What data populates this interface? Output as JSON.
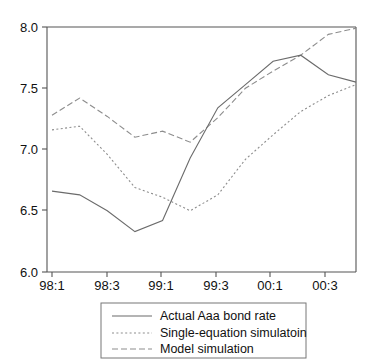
{
  "chart_data": {
    "type": "line",
    "title": "",
    "subtitle": "",
    "xlabel": "",
    "ylabel": "",
    "x": [
      "98:1",
      "98:2",
      "98:3",
      "98:4",
      "99:1",
      "99:2",
      "99:3",
      "99:4",
      "00:1",
      "00:2",
      "00:3",
      "00:4"
    ],
    "xtick_labels": [
      "98:1",
      "98:3",
      "99:1",
      "99:3",
      "00:1",
      "00:3"
    ],
    "xtick_positions": [
      "98:1",
      "98:3",
      "99:1",
      "99:3",
      "00:1",
      "00:3"
    ],
    "ytick_labels": [
      "6.0",
      "6.5",
      "7.0",
      "7.5",
      "8.0"
    ],
    "ytick_values": [
      6.0,
      6.5,
      7.0,
      7.5,
      8.0
    ],
    "ylim": [
      6.0,
      8.0
    ],
    "grid": false,
    "legend_position": "below-center",
    "series": [
      {
        "name": "Actual Aaa bond rate",
        "style": "solid",
        "color": "#6b6b6b",
        "values": [
          6.66,
          6.63,
          6.5,
          6.33,
          6.42,
          6.93,
          7.34,
          7.53,
          7.72,
          7.77,
          7.61,
          7.55
        ]
      },
      {
        "name": "Single-equation simulatoin",
        "style": "dotted",
        "color": "#8d8d8d",
        "values": [
          7.16,
          7.19,
          6.96,
          6.69,
          6.61,
          6.5,
          6.63,
          6.92,
          7.12,
          7.31,
          7.44,
          7.53
        ]
      },
      {
        "name": "Model simulation",
        "style": "dashed",
        "color": "#8d8d8d",
        "values": [
          7.28,
          7.42,
          7.27,
          7.1,
          7.15,
          7.06,
          7.26,
          7.5,
          7.64,
          7.77,
          7.94,
          7.99
        ]
      }
    ]
  },
  "legend": {
    "entries": [
      {
        "label": "Actual Aaa bond rate",
        "style": "solid"
      },
      {
        "label": "Single-equation simulatoin",
        "style": "dotted"
      },
      {
        "label": "Model simulation",
        "style": "dashed"
      }
    ]
  },
  "axes": {
    "y_ticks": [
      "8.0",
      "7.5",
      "7.0",
      "6.5",
      "6.0"
    ],
    "x_ticks": [
      "98:1",
      "98:3",
      "99:1",
      "99:3",
      "00:1",
      "00:3"
    ]
  }
}
